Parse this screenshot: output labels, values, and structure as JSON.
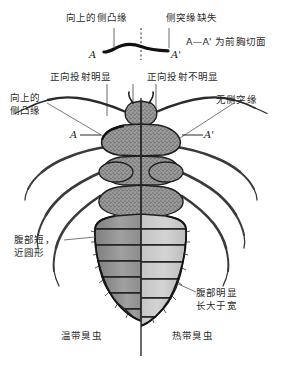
{
  "figure": {
    "title_note": "A—A' 为前胸切面",
    "center_axis": "midline"
  },
  "cross_section": {
    "left_point_label": "A",
    "right_point_label": "A'",
    "caption": "A—A' 为前胸切面"
  },
  "annotations": {
    "top_left": "向上的侧凸缘",
    "top_right": "侧突缘缺失",
    "mid_left": "正向投射明显",
    "mid_right": "正向投射不明显",
    "side_left_line1": "向上的",
    "side_left_line2": "侧凸缘",
    "side_right": "无侧突缘",
    "pronotum_left_marker": "A",
    "pronotum_right_marker": "A'",
    "abdomen_left_line1": "腹部短，",
    "abdomen_left_line2": "近圆形",
    "abdomen_right_line1": "腹部明显",
    "abdomen_right_line2": "长大于宽"
  },
  "species": {
    "left_name": "温带臭虫",
    "right_name": "热带臭虫"
  },
  "colors": {
    "ink": "#1a1a1a",
    "text": "#2b2b2b",
    "body_dark": "#8a8a8a",
    "body_light": "#c9c9c9",
    "outline": "#2a2a2a",
    "leader_line": "#555555",
    "background": "#ffffff"
  }
}
